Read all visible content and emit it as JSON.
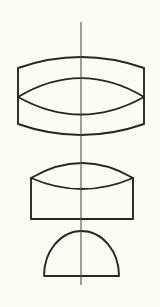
{
  "document": {
    "kind": "geometric-line-drawing",
    "title": "Stacked solids of revolution with vertical axis",
    "width": 160,
    "height": 307,
    "background_color": "#fdfdf5",
    "stroke_color": "#2a2622",
    "axis_color": "#55514c"
  },
  "axis": {
    "label": "vertical-centerline",
    "x": 81,
    "y_top": 22,
    "y_bottom": 285,
    "stroke_width": 1.1,
    "color": "#55514c"
  },
  "shapes": [
    {
      "id": "top-barrel",
      "label": "barrel with inscribed lens",
      "left": 18,
      "right": 144,
      "side_top": 68,
      "side_bottom": 124,
      "cap_top_apex": 57,
      "cap_bottom_apex": 135,
      "lens_tip_y": 97,
      "lens_top_apex": 68,
      "lens_bottom_apex": 124,
      "stroke_width": 1.9
    },
    {
      "id": "middle-box-lens",
      "label": "rectangle capped by lens",
      "left": 31,
      "right": 133,
      "rect_top": 178,
      "rect_bottom": 219,
      "lens_top_apex": 155,
      "lens_bottom_apex": 195,
      "stroke_width": 1.9
    },
    {
      "id": "bottom-semicircle",
      "label": "semicircle on flat base",
      "left": 44,
      "right": 119,
      "base_y": 276,
      "top_y": 231,
      "stroke_width": 1.9
    }
  ]
}
